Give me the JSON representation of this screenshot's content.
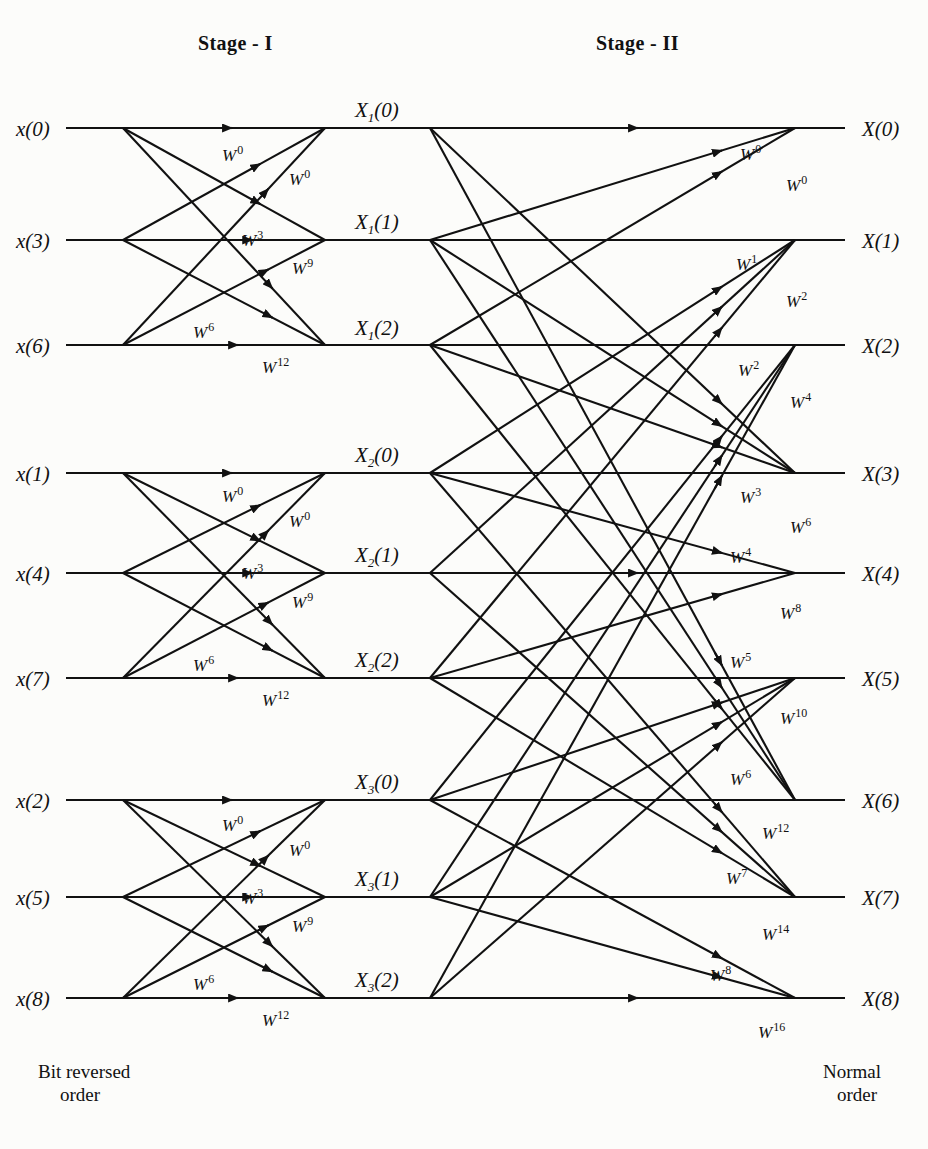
{
  "figure": {
    "type": "fft-butterfly-signal-flow-graph",
    "stages": [
      {
        "id": "stage1",
        "title": "Stage - I"
      },
      {
        "id": "stage2",
        "title": "Stage - II"
      }
    ],
    "footer": {
      "left_line1": "Bit reversed",
      "left_line2": "order",
      "right_line1": "Normal",
      "right_line2": "order"
    },
    "geometry": {
      "row_y": [
        128,
        240,
        345,
        473,
        573,
        678,
        800,
        897,
        998
      ],
      "x_input_line_start": 66,
      "x_stage1_split": 123,
      "x_stage1_merge": 325,
      "x_stage2_split": 430,
      "x_stage2_merge": 795,
      "x_output_line_end": 845
    }
  },
  "inputs": [
    {
      "name": "x(0)",
      "base": "x",
      "index": "(0)",
      "row": 0
    },
    {
      "name": "x(3)",
      "base": "x",
      "index": "(3)",
      "row": 1
    },
    {
      "name": "x(6)",
      "base": "x",
      "index": "(6)",
      "row": 2
    },
    {
      "name": "x(1)",
      "base": "x",
      "index": "(1)",
      "row": 3
    },
    {
      "name": "x(4)",
      "base": "x",
      "index": "(4)",
      "row": 4
    },
    {
      "name": "x(7)",
      "base": "x",
      "index": "(7)",
      "row": 5
    },
    {
      "name": "x(2)",
      "base": "x",
      "index": "(2)",
      "row": 6
    },
    {
      "name": "x(5)",
      "base": "x",
      "index": "(5)",
      "row": 7
    },
    {
      "name": "x(8)",
      "base": "x",
      "index": "(8)",
      "row": 8
    }
  ],
  "outputs": [
    {
      "name": "X(0)",
      "base": "X",
      "index": "(0)",
      "row": 0
    },
    {
      "name": "X(1)",
      "base": "X",
      "index": "(1)",
      "row": 1
    },
    {
      "name": "X(2)",
      "base": "X",
      "index": "(2)",
      "row": 2
    },
    {
      "name": "X(3)",
      "base": "X",
      "index": "(3)",
      "row": 3
    },
    {
      "name": "X(4)",
      "base": "X",
      "index": "(4)",
      "row": 4
    },
    {
      "name": "X(5)",
      "base": "X",
      "index": "(5)",
      "row": 5
    },
    {
      "name": "X(6)",
      "base": "X",
      "index": "(6)",
      "row": 6
    },
    {
      "name": "X(7)",
      "base": "X",
      "index": "(7)",
      "row": 7
    },
    {
      "name": "X(8)",
      "base": "X",
      "index": "(8)",
      "row": 8
    }
  ],
  "intermediate_labels": [
    {
      "base": "X",
      "sub": "1",
      "index": "(0)",
      "row": 0,
      "x": 355,
      "y": 98
    },
    {
      "base": "X",
      "sub": "1",
      "index": "(1)",
      "row": 1,
      "x": 355,
      "y": 210
    },
    {
      "base": "X",
      "sub": "1",
      "index": "(2)",
      "row": 2,
      "x": 355,
      "y": 316
    },
    {
      "base": "X",
      "sub": "2",
      "index": "(0)",
      "row": 3,
      "x": 355,
      "y": 443
    },
    {
      "base": "X",
      "sub": "2",
      "index": "(1)",
      "row": 4,
      "x": 355,
      "y": 543
    },
    {
      "base": "X",
      "sub": "2",
      "index": "(2)",
      "row": 5,
      "x": 355,
      "y": 648
    },
    {
      "base": "X",
      "sub": "3",
      "index": "(0)",
      "row": 6,
      "x": 355,
      "y": 770
    },
    {
      "base": "X",
      "sub": "3",
      "index": "(1)",
      "row": 7,
      "x": 355,
      "y": 867
    },
    {
      "base": "X",
      "sub": "3",
      "index": "(2)",
      "row": 8,
      "x": 355,
      "y": 968
    }
  ],
  "stage1_twiddles": [
    {
      "w": "W",
      "exp": "0",
      "x": 222,
      "y": 143,
      "group": 1
    },
    {
      "w": "W",
      "exp": "0",
      "x": 289,
      "y": 167,
      "group": 1
    },
    {
      "w": "W",
      "exp": "3",
      "x": 242,
      "y": 228,
      "group": 1
    },
    {
      "w": "W",
      "exp": "9",
      "x": 292,
      "y": 256,
      "group": 1
    },
    {
      "w": "W",
      "exp": "6",
      "x": 193,
      "y": 320,
      "group": 1
    },
    {
      "w": "W",
      "exp": "12",
      "x": 262,
      "y": 355,
      "group": 1
    },
    {
      "w": "W",
      "exp": "0",
      "x": 222,
      "y": 484,
      "group": 2
    },
    {
      "w": "W",
      "exp": "0",
      "x": 289,
      "y": 509,
      "group": 2
    },
    {
      "w": "W",
      "exp": "3",
      "x": 242,
      "y": 561,
      "group": 2
    },
    {
      "w": "W",
      "exp": "9",
      "x": 292,
      "y": 590,
      "group": 2
    },
    {
      "w": "W",
      "exp": "6",
      "x": 193,
      "y": 653,
      "group": 2
    },
    {
      "w": "W",
      "exp": "12",
      "x": 262,
      "y": 688,
      "group": 2
    },
    {
      "w": "W",
      "exp": "0",
      "x": 222,
      "y": 813,
      "group": 3
    },
    {
      "w": "W",
      "exp": "0",
      "x": 289,
      "y": 838,
      "group": 3
    },
    {
      "w": "W",
      "exp": "3",
      "x": 242,
      "y": 886,
      "group": 3
    },
    {
      "w": "W",
      "exp": "9",
      "x": 292,
      "y": 914,
      "group": 3
    },
    {
      "w": "W",
      "exp": "6",
      "x": 193,
      "y": 972,
      "group": 3
    },
    {
      "w": "W",
      "exp": "12",
      "x": 262,
      "y": 1008,
      "group": 3
    }
  ],
  "stage2_twiddles": [
    {
      "w": "W",
      "exp": "0",
      "x": 740,
      "y": 142
    },
    {
      "w": "W",
      "exp": "0",
      "x": 786,
      "y": 173
    },
    {
      "w": "W",
      "exp": "1",
      "x": 736,
      "y": 252
    },
    {
      "w": "W",
      "exp": "2",
      "x": 786,
      "y": 289
    },
    {
      "w": "W",
      "exp": "2",
      "x": 738,
      "y": 358
    },
    {
      "w": "W",
      "exp": "4",
      "x": 790,
      "y": 390
    },
    {
      "w": "W",
      "exp": "3",
      "x": 740,
      "y": 485
    },
    {
      "w": "W",
      "exp": "6",
      "x": 790,
      "y": 515
    },
    {
      "w": "W",
      "exp": "4",
      "x": 730,
      "y": 545
    },
    {
      "w": "W",
      "exp": "8",
      "x": 780,
      "y": 601
    },
    {
      "w": "W",
      "exp": "5",
      "x": 730,
      "y": 650
    },
    {
      "w": "W",
      "exp": "10",
      "x": 780,
      "y": 706
    },
    {
      "w": "W",
      "exp": "6",
      "x": 730,
      "y": 767
    },
    {
      "w": "W",
      "exp": "12",
      "x": 762,
      "y": 821
    },
    {
      "w": "W",
      "exp": "7",
      "x": 726,
      "y": 866
    },
    {
      "w": "W",
      "exp": "14",
      "x": 762,
      "y": 922
    },
    {
      "w": "W",
      "exp": "8",
      "x": 710,
      "y": 963
    },
    {
      "w": "W",
      "exp": "16",
      "x": 758,
      "y": 1020
    }
  ],
  "colors": {
    "line": "#111111",
    "background": "#fcfcfa",
    "text": "#111111"
  }
}
